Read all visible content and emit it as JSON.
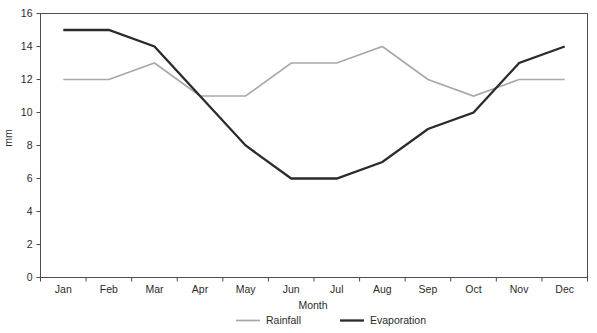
{
  "chart_data": {
    "type": "line",
    "title": "",
    "xlabel": "Month",
    "ylabel": "mm",
    "categories": [
      "Jan",
      "Feb",
      "Mar",
      "Apr",
      "May",
      "Jun",
      "Jul",
      "Aug",
      "Sep",
      "Oct",
      "Nov",
      "Dec"
    ],
    "series": [
      {
        "name": "Rainfall",
        "color": "#a8a8a8",
        "line_width": 1.7,
        "values": [
          12,
          12,
          13,
          11,
          11,
          13,
          13,
          14,
          12,
          11,
          12,
          12
        ]
      },
      {
        "name": "Evaporation",
        "color": "#2b2b2b",
        "line_width": 2.3,
        "values": [
          15,
          15,
          14,
          11,
          8,
          6,
          6,
          7,
          9,
          10,
          13,
          14
        ]
      }
    ],
    "ylim": [
      0,
      16
    ],
    "yticks": [
      0,
      2,
      4,
      6,
      8,
      10,
      12,
      14,
      16
    ],
    "ytick_labels": [
      "0",
      "2",
      "4",
      "6",
      "8",
      "10",
      "12",
      "14",
      "16"
    ],
    "grid": false,
    "legend_position": "bottom",
    "axis_color": "#4d4d4d",
    "text_color": "#2b2b2b"
  }
}
